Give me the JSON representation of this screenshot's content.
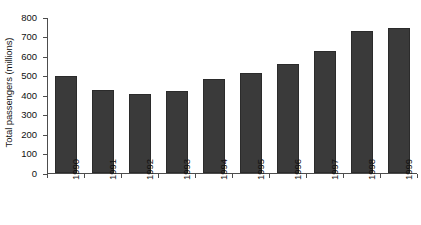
{
  "chart_data": {
    "type": "bar",
    "title": "",
    "subtitle": "",
    "xlabel": "",
    "ylabel": "Total passengers (millions)",
    "categories": [
      "1990",
      "1991",
      "1992",
      "1993",
      "1994",
      "1995",
      "1996",
      "1997",
      "1998",
      "1999"
    ],
    "values": [
      495,
      428,
      403,
      420,
      480,
      512,
      557,
      625,
      728,
      743
    ],
    "series": [
      {
        "name": "Total passengers",
        "values": [
          495,
          428,
          403,
          420,
          480,
          512,
          557,
          625,
          728,
          743
        ]
      }
    ],
    "ylim": [
      0,
      800
    ],
    "ytick_labels": [
      "800",
      "700",
      "600",
      "500",
      "400",
      "300",
      "200",
      "100",
      "0"
    ],
    "ytick_values": [
      800,
      700,
      600,
      500,
      400,
      300,
      200,
      100,
      0
    ],
    "ytick_step": 100,
    "grid": false,
    "legend": false,
    "legend_position": "none",
    "bar_color": "#3a3a3a",
    "axis_color": "#4d4d4d",
    "background_color": "#ffffff",
    "text_color": "#111111",
    "xtick_rotation": -90,
    "annotations": []
  },
  "caption": {
    "text": ""
  }
}
